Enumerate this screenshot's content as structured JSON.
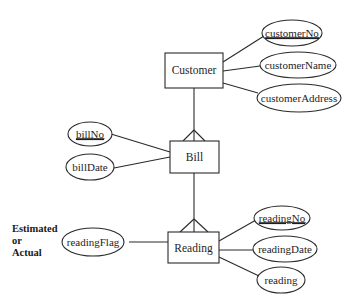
{
  "diagram": {
    "type": "entity-relationship",
    "notation": "crows-foot",
    "entities": [
      {
        "name": "Customer",
        "attributes": [
          {
            "name": "customerNo",
            "key": true
          },
          {
            "name": "customerName",
            "key": false
          },
          {
            "name": "customerAddress",
            "key": false
          }
        ]
      },
      {
        "name": "Bill",
        "attributes": [
          {
            "name": "billNo",
            "key": true
          },
          {
            "name": "billDate",
            "key": false
          }
        ]
      },
      {
        "name": "Reading",
        "attributes": [
          {
            "name": "readingFlag",
            "key": false
          },
          {
            "name": "readingNo",
            "key": true
          },
          {
            "name": "readingDate",
            "key": false
          },
          {
            "name": "reading",
            "key": false
          }
        ]
      }
    ],
    "relationships": [
      {
        "from": "Customer",
        "to": "Bill",
        "cardinality": "one-to-many"
      },
      {
        "from": "Bill",
        "to": "Reading",
        "cardinality": "one-to-many"
      }
    ],
    "annotation": {
      "target": "readingFlag",
      "lines": [
        "Estimated",
        "or",
        "Actual"
      ]
    }
  }
}
